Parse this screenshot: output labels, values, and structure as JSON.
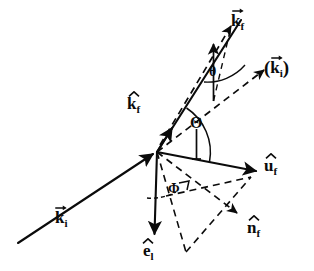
{
  "figure": {
    "kind": "vector-geometry-diagram",
    "background_color": "#ffffff",
    "ink_color": "#0b0b0b",
    "width": 314,
    "height": 271
  },
  "origin": {
    "x": 157,
    "y": 152,
    "label": "vertex"
  },
  "labels": {
    "k_f_vector": {
      "base": "k",
      "sub": "f",
      "accent": "vector",
      "open_paren": "",
      "close_paren": "",
      "x": 232,
      "y": 15,
      "desc": "final wave vector k_f"
    },
    "k_i_parenthesized": {
      "base": "k",
      "sub": "i",
      "accent": "vector",
      "open_paren": "(",
      "close_paren": ")",
      "x": 268,
      "y": 60,
      "desc": "incident wave vector translated to origin, shown in parentheses"
    },
    "k_f_hat": {
      "base": "k",
      "sub": "f",
      "accent": "hat",
      "open_paren": "",
      "close_paren": "",
      "x": 128,
      "y": 97,
      "desc": "unit vector along final wave vector"
    },
    "u_f_hat": {
      "base": "u",
      "sub": "f",
      "accent": "hat",
      "open_paren": "",
      "close_paren": "",
      "x": 266,
      "y": 159,
      "desc": "unit vector u_f"
    },
    "n_f_hat": {
      "base": "n",
      "sub": "f",
      "accent": "hat",
      "open_paren": "",
      "close_paren": "",
      "x": 249,
      "y": 222,
      "desc": "unit normal vector n_f"
    },
    "e_l_hat": {
      "base": "e",
      "sub": "l",
      "accent": "hat",
      "open_paren": "",
      "close_paren": "",
      "x": 145,
      "y": 245,
      "desc": "unit polarization vector e_l"
    },
    "k_i_vector": {
      "base": "k",
      "sub": "i",
      "accent": "vector",
      "open_paren": "",
      "close_paren": "",
      "x": 56,
      "y": 212,
      "desc": "incident wave vector k_i"
    }
  },
  "angles": {
    "theta_small": {
      "glyph": "θ",
      "x": 217,
      "y": 68,
      "size": "small",
      "desc": "lowercase theta between vertical reference line and dashed k_i direction"
    },
    "theta_capital": {
      "glyph": "Θ",
      "x": 191,
      "y": 135,
      "size": "big",
      "desc": "capital Theta scattering angle between k_f hat and u_f axis"
    },
    "phi": {
      "glyph": "Φ",
      "x": 173,
      "y": 189,
      "size": "small",
      "desc": "capital Phi azimuthal angle in the lower plane"
    }
  },
  "geometry": {
    "solid_lines": [
      {
        "name": "k-i-incident-ray",
        "x1": 18,
        "y1": 243,
        "x2": 157,
        "y2": 152,
        "arrow_at": "end"
      },
      {
        "name": "k-f-hat-ray",
        "x1": 157,
        "y1": 152,
        "x2": 240,
        "y2": 22,
        "arrow_at": "none"
      },
      {
        "name": "u-f-axis",
        "x1": 157,
        "y1": 152,
        "x2": 258,
        "y2": 172,
        "arrow_at": "end"
      },
      {
        "name": "e-l-axis",
        "x1": 157,
        "y1": 152,
        "x2": 154,
        "y2": 237,
        "arrow_at": "end"
      },
      {
        "name": "theta-small-drop-line",
        "x1": 213,
        "y1": 45,
        "x2": 214,
        "y2": 101,
        "arrow_at": "start"
      },
      {
        "name": "theta-capital-drop-line",
        "x1": 196,
        "y1": 130,
        "x2": 197,
        "y2": 163,
        "arrow_at": "none"
      },
      {
        "name": "k-f-hat-arrow-tip",
        "x1": 157,
        "y1": 152,
        "x2": 174,
        "y2": 125,
        "arrow_at": "end"
      }
    ],
    "dashed_lines": [
      {
        "name": "k-f-vector-dashed",
        "x1": 175,
        "y1": 118,
        "x2": 233,
        "y2": 28,
        "arrow_at": "end"
      },
      {
        "name": "k-i-parenthesized-dashed",
        "x1": 157,
        "y1": 152,
        "x2": 265,
        "y2": 69,
        "arrow_at": "end"
      },
      {
        "name": "n-f-dashed",
        "x1": 157,
        "y1": 152,
        "x2": 238,
        "y2": 214,
        "arrow_at": "end"
      },
      {
        "name": "phi-left-leg",
        "x1": 157,
        "y1": 152,
        "x2": 185,
        "y2": 251
      },
      {
        "name": "phi-base-leg",
        "x1": 185,
        "y1": 251,
        "x2": 252,
        "y2": 178
      },
      {
        "name": "phi-to-uf-leg",
        "x1": 166,
        "y1": 194,
        "x2": 252,
        "y2": 178
      },
      {
        "name": "theta-closing-leg",
        "x1": 214,
        "y1": 101,
        "x2": 233,
        "y2": 28
      }
    ],
    "arcs": [
      {
        "name": "theta-capital-arc",
        "cx": 157,
        "cy": 152,
        "r": 44,
        "desc": "arc spanning Theta"
      },
      {
        "name": "theta-small-arc",
        "cx": 233,
        "cy": 28,
        "r": 44,
        "desc": "arc spanning small theta"
      },
      {
        "name": "phi-arc",
        "cx": 157,
        "cy": 152,
        "r": 48,
        "desc": "arc spanning Phi"
      }
    ],
    "right_angle_marks": [
      {
        "name": "phi-right-angle",
        "x": 179,
        "y": 183
      }
    ]
  }
}
